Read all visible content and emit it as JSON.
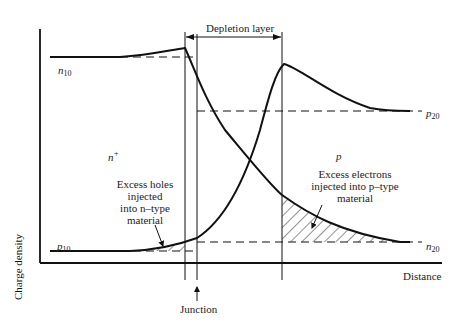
{
  "diagram": {
    "title": "",
    "depletion_layer_label": "Depletion layer",
    "junction_label": "Junction",
    "axis": {
      "x_label": "Distance",
      "y_label": "Charge density"
    },
    "regions": {
      "n_region": {
        "symbol": "n",
        "superscript": "+"
      },
      "p_region": {
        "symbol": "p"
      }
    },
    "levels": {
      "n10": {
        "symbol": "n",
        "subscript": "10"
      },
      "p20": {
        "symbol": "p",
        "subscript": "20"
      },
      "n20": {
        "symbol": "n",
        "subscript": "20"
      },
      "p10": {
        "symbol": "p",
        "subscript": "10"
      }
    },
    "annotations": {
      "holes": [
        "Excess holes",
        "injected",
        "into n–type",
        "material"
      ],
      "electrons": [
        "Excess electrons",
        "injected into p–type",
        "material"
      ]
    },
    "colors": {
      "line": "#111111",
      "background": "#ffffff"
    }
  }
}
